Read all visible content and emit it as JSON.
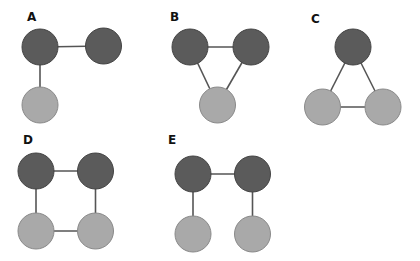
{
  "colors": {
    "dark_node": "#5b5b5b",
    "dark_node_stroke": "#444444",
    "light_node": "#a9a9a9",
    "light_node_stroke": "#8a8a8a",
    "edge": "#555555",
    "background": "#ffffff"
  },
  "node_radius": 18,
  "panels": [
    {
      "label": "A",
      "label_pos": [
        27,
        11
      ],
      "nodes": [
        {
          "id": "a1",
          "x": 40,
          "y": 47,
          "type": "dark"
        },
        {
          "id": "a2",
          "x": 103.5,
          "y": 46,
          "type": "dark"
        },
        {
          "id": "a3",
          "x": 40,
          "y": 105,
          "type": "light"
        }
      ],
      "edges": [
        [
          "a1",
          "a2"
        ],
        [
          "a1",
          "a3"
        ]
      ]
    },
    {
      "label": "B",
      "label_pos": [
        170,
        11
      ],
      "nodes": [
        {
          "id": "b1",
          "x": 190,
          "y": 47,
          "type": "dark"
        },
        {
          "id": "b2",
          "x": 251,
          "y": 47,
          "type": "dark"
        },
        {
          "id": "b3",
          "x": 217.5,
          "y": 105,
          "type": "light"
        }
      ],
      "edges": [
        [
          "b1",
          "b2"
        ],
        [
          "b1",
          "b3"
        ],
        [
          "b2",
          "b3"
        ]
      ]
    },
    {
      "label": "C",
      "label_pos": [
        311,
        13
      ],
      "nodes": [
        {
          "id": "c1",
          "x": 353,
          "y": 47,
          "type": "dark"
        },
        {
          "id": "c2",
          "x": 322.5,
          "y": 107,
          "type": "light"
        },
        {
          "id": "c3",
          "x": 383,
          "y": 107,
          "type": "light"
        }
      ],
      "edges": [
        [
          "c1",
          "c2"
        ],
        [
          "c1",
          "c3"
        ],
        [
          "c2",
          "c3"
        ]
      ]
    },
    {
      "label": "D",
      "label_pos": [
        23,
        134
      ],
      "nodes": [
        {
          "id": "d1",
          "x": 36,
          "y": 171,
          "type": "dark"
        },
        {
          "id": "d2",
          "x": 95.5,
          "y": 171,
          "type": "dark"
        },
        {
          "id": "d3",
          "x": 36,
          "y": 231,
          "type": "light"
        },
        {
          "id": "d4",
          "x": 95.5,
          "y": 231,
          "type": "light"
        }
      ],
      "edges": [
        [
          "d1",
          "d2"
        ],
        [
          "d1",
          "d3"
        ],
        [
          "d2",
          "d4"
        ],
        [
          "d3",
          "d4"
        ]
      ]
    },
    {
      "label": "E",
      "label_pos": [
        168,
        134
      ],
      "nodes": [
        {
          "id": "e1",
          "x": 193,
          "y": 174,
          "type": "dark"
        },
        {
          "id": "e2",
          "x": 252.5,
          "y": 174,
          "type": "dark"
        },
        {
          "id": "e3",
          "x": 193,
          "y": 234,
          "type": "light"
        },
        {
          "id": "e4",
          "x": 252.5,
          "y": 234,
          "type": "light"
        }
      ],
      "edges": [
        [
          "e1",
          "e2"
        ],
        [
          "e1",
          "e3"
        ],
        [
          "e2",
          "e4"
        ]
      ]
    }
  ]
}
